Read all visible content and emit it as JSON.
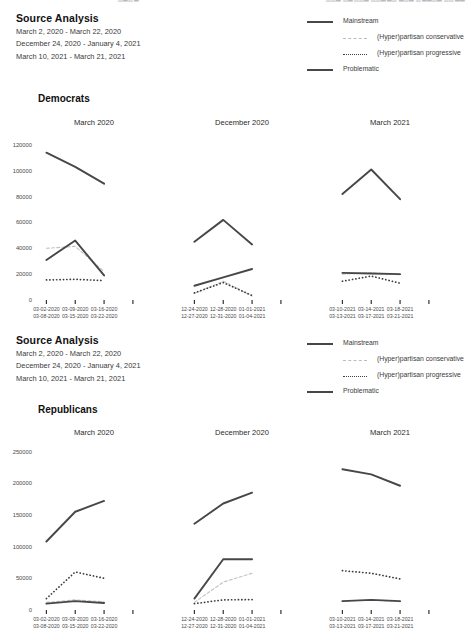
{
  "top_fragment": {
    "left": "▁▃▁▂",
    "right": "▁▁▃ ▁▂▁▁▃ ▁▁▂▃▁ ▃▁▂ ▁▂▃▁▂ ▁▁▃▂"
  },
  "sections": [
    {
      "id": "democrats",
      "source_analysis_title": "Source Analysis",
      "date_ranges": [
        "March 2, 2020 - March 22, 2020",
        "December 24, 2020 - January 4, 2021",
        "March 10, 2021 - March 21, 2021"
      ],
      "group_title": "Democrats",
      "legend": [
        {
          "label": "Mainstream",
          "style": "solid",
          "color": "#474747",
          "indent": false
        },
        {
          "label": "(Hyper)partisan conservative",
          "style": "dash",
          "color": "#bcbcbc",
          "indent": true
        },
        {
          "label": "(Hyper)partisan progressive",
          "style": "dot",
          "color": "#3d3d3d",
          "indent": true
        },
        {
          "label": "Problematic",
          "style": "solid",
          "color": "#474747",
          "indent": false
        }
      ]
    },
    {
      "id": "republicans",
      "source_analysis_title": "Source Analysis",
      "date_ranges": [
        "March 2, 2020 - March 22, 2020",
        "December 24, 2020 - January 4, 2021",
        "March 10, 2021 - March 21, 2021"
      ],
      "group_title": "Republicans",
      "legend": [
        {
          "label": "Mainstream",
          "style": "solid",
          "color": "#474747",
          "indent": false
        },
        {
          "label": "(Hyper)partisan conservative",
          "style": "dash",
          "color": "#bcbcbc",
          "indent": true
        },
        {
          "label": "(Hyper)partisan progressive",
          "style": "dot",
          "color": "#3d3d3d",
          "indent": true
        },
        {
          "label": "Problematic",
          "style": "solid",
          "color": "#474747",
          "indent": false
        }
      ]
    }
  ],
  "chart_data": [
    {
      "type": "line",
      "title": "Democrats",
      "ylabel": "",
      "xlabel": "",
      "ylim": [
        0,
        130000
      ],
      "yticks": [
        0,
        20000,
        40000,
        60000,
        80000,
        100000,
        120000
      ],
      "ytick_labels": [
        "0",
        "20000",
        "40000",
        "60000",
        "80000",
        "100000",
        "120000"
      ],
      "grid": false,
      "legend_position": "top-right",
      "panels": [
        {
          "title": "March 2020",
          "categories": [
            "03-02-2020\n03-08-2020",
            "03-09-2020\n03-15-2020",
            "03-16-2020\n03-22-2020"
          ],
          "x_tick_labels": [
            [
              "03-02-2020",
              "03-08-2020"
            ],
            [
              "03-09-2020",
              "03-15-2020"
            ],
            [
              "03-16-2020",
              "03-22-2020"
            ]
          ],
          "series": [
            {
              "name": "Mainstream",
              "style": "solid",
              "values": [
                114000,
                103000,
                90000
              ]
            },
            {
              "name": "(Hyper)partisan conservative",
              "style": "dash",
              "values": [
                40000,
                41500,
                22000
              ]
            },
            {
              "name": "(Hyper)partisan progressive",
              "style": "dot",
              "values": [
                15500,
                16000,
                15000
              ]
            },
            {
              "name": "Problematic",
              "style": "solid",
              "values": [
                31000,
                46000,
                19000
              ]
            }
          ]
        },
        {
          "title": "December 2020",
          "categories": [
            "12-24-2020\n12-27-2020",
            "12-28-2020\n12-31-2020",
            "01-01-2021\n01-04-2021"
          ],
          "x_tick_labels": [
            [
              "12-24-2020",
              "12-27-2020"
            ],
            [
              "12-28-2020",
              "12-31-2020"
            ],
            [
              "01-01-2021",
              "01-04-2021"
            ]
          ],
          "series": [
            {
              "name": "Mainstream",
              "style": "solid",
              "values": [
                45000,
                62000,
                43000
              ]
            },
            {
              "name": "(Hyper)partisan conservative",
              "style": "dash",
              "values": [
                5000,
                14500,
                3000
              ]
            },
            {
              "name": "(Hyper)partisan progressive",
              "style": "dot",
              "values": [
                5500,
                13500,
                3500
              ]
            },
            {
              "name": "Problematic",
              "style": "solid",
              "values": [
                11000,
                17500,
                24000
              ]
            }
          ]
        },
        {
          "title": "March 2021",
          "categories": [
            "03-10-2021\n03-13-2021",
            "03-14-2021\n03-17-2021",
            "03-18-2021\n03-21-2021"
          ],
          "x_tick_labels": [
            [
              "03-10-2021",
              "03-13-2021"
            ],
            [
              "03-14-2021",
              "03-17-2021"
            ],
            [
              "03-18-2021",
              "03-21-2021"
            ]
          ],
          "series": [
            {
              "name": "Mainstream",
              "style": "solid",
              "values": [
                82000,
                101000,
                78000
              ]
            },
            {
              "name": "(Hyper)partisan conservative",
              "style": "dash",
              "values": [
                20000,
                21000,
                19500
              ]
            },
            {
              "name": "(Hyper)partisan progressive",
              "style": "dot",
              "values": [
                14500,
                18500,
                13000
              ]
            },
            {
              "name": "Problematic",
              "style": "solid",
              "values": [
                21000,
                20500,
                20000
              ]
            }
          ]
        }
      ]
    },
    {
      "type": "line",
      "title": "Republicans",
      "ylabel": "",
      "xlabel": "",
      "ylim": [
        0,
        265000
      ],
      "yticks": [
        0,
        50000,
        100000,
        150000,
        200000,
        250000
      ],
      "ytick_labels": [
        "0",
        "50000",
        "100000",
        "150000",
        "200000",
        "250000"
      ],
      "grid": false,
      "legend_position": "top-right",
      "panels": [
        {
          "title": "March 2020",
          "categories": [
            "03-02-2020\n03-08-2020",
            "03-09-2020\n03-15-2020",
            "03-16-2020\n03-22-2020"
          ],
          "x_tick_labels": [
            [
              "03-02-2020",
              "03-08-2020"
            ],
            [
              "03-09-2020",
              "03-15-2020"
            ],
            [
              "03-16-2020",
              "03-22-2020"
            ]
          ],
          "series": [
            {
              "name": "Mainstream",
              "style": "solid",
              "values": [
                108000,
                155000,
                172000
              ]
            },
            {
              "name": "(Hyper)partisan conservative",
              "style": "dash",
              "values": [
                12000,
                16000,
                13000
              ]
            },
            {
              "name": "(Hyper)partisan progressive",
              "style": "dot",
              "values": [
                18000,
                60000,
                50000
              ]
            },
            {
              "name": "Problematic",
              "style": "solid",
              "values": [
                10000,
                14000,
                11000
              ]
            }
          ]
        },
        {
          "title": "December 2020",
          "categories": [
            "12-24-2020\n12-27-2020",
            "12-28-2020\n12-31-2020",
            "01-01-2021\n01-04-2021"
          ],
          "x_tick_labels": [
            [
              "12-24-2020",
              "12-27-2020"
            ],
            [
              "12-28-2020",
              "12-31-2020"
            ],
            [
              "01-01-2021",
              "01-04-2021"
            ]
          ],
          "series": [
            {
              "name": "Mainstream",
              "style": "solid",
              "values": [
                136000,
                168000,
                185000
              ]
            },
            {
              "name": "(Hyper)partisan conservative",
              "style": "dash",
              "values": [
                12000,
                44000,
                58000
              ]
            },
            {
              "name": "(Hyper)partisan progressive",
              "style": "dot",
              "values": [
                10000,
                16000,
                16500
              ]
            },
            {
              "name": "Problematic",
              "style": "solid",
              "values": [
                18000,
                80000,
                80000
              ]
            }
          ]
        },
        {
          "title": "March 2021",
          "categories": [
            "03-10-2021\n03-13-2021",
            "03-14-2021\n03-17-2021",
            "03-18-2021\n03-21-2021"
          ],
          "x_tick_labels": [
            [
              "03-10-2021",
              "03-13-2021"
            ],
            [
              "03-14-2021",
              "03-17-2021"
            ],
            [
              "03-18-2021",
              "03-21-2021"
            ]
          ],
          "series": [
            {
              "name": "Mainstream",
              "style": "solid",
              "values": [
                222000,
                214000,
                196000
              ]
            },
            {
              "name": "(Hyper)partisan conservative",
              "style": "dash",
              "values": [
                14000,
                16000,
                13000
              ]
            },
            {
              "name": "(Hyper)partisan progressive",
              "style": "dot",
              "values": [
                62000,
                58000,
                49000
              ]
            },
            {
              "name": "Problematic",
              "style": "solid",
              "values": [
                14000,
                16000,
                14000
              ]
            }
          ]
        }
      ]
    }
  ]
}
